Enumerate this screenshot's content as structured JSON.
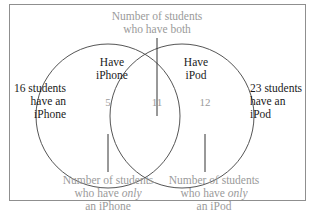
{
  "diagram": {
    "type": "venn",
    "sets": [
      {
        "label_line1": "Have",
        "label_line2": "iPhone",
        "only_value": "5",
        "total_line1": "16 students",
        "total_line2": "have an",
        "total_line3": "iPhone"
      },
      {
        "label_line1": "Have",
        "label_line2": "iPod",
        "only_value": "12",
        "total_line1": "23 students",
        "total_line2": "have an",
        "total_line3": "iPod"
      }
    ],
    "intersection_value": "11",
    "annotations": {
      "both_line1": "Number of students",
      "both_line2": "who have both",
      "only_iphone_line1": "Number of students",
      "only_iphone_line2_pre": "who have ",
      "only_iphone_line2_em": "only",
      "only_iphone_line3": "an iPhone",
      "only_ipod_line1": "Number of students",
      "only_ipod_line2_pre": "who have ",
      "only_ipod_line2_em": "only",
      "only_ipod_line3": "an iPod"
    },
    "colors": {
      "text_dark": "#1a1a1a",
      "text_grey": "#9a9a9a",
      "line": "#555555",
      "border": "#8f8f8f"
    }
  }
}
